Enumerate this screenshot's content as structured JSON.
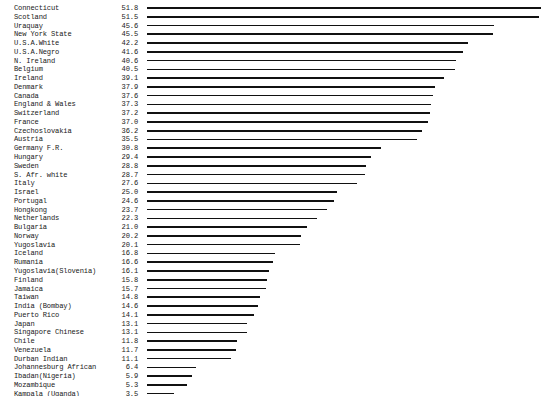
{
  "chart_data": {
    "type": "bar",
    "orientation": "horizontal",
    "title": "",
    "subtitle": "",
    "xlabel": "",
    "ylabel": "",
    "legend": [],
    "grid": false,
    "xlim": [
      0,
      51.8
    ],
    "axis_visible": false,
    "value_labels_shown": true,
    "categories": [
      "Connecticut",
      "Scotland",
      "Uraquay",
      "New York State",
      "U.S.A.White",
      "U.S.A.Negro",
      "N. Ireland",
      "Belgium",
      "Ireland",
      "Denmark",
      "Canada",
      "England & Wales",
      "Switzerland",
      "France",
      "Czechoslovakia",
      "Austria",
      "Germany F.R.",
      "Hungary",
      "Sweden",
      "S. Afr. white",
      "Italy",
      "Israel",
      "Portugal",
      "Hongkong",
      "Netherlands",
      "Bulgaria",
      "Norway",
      "Yugoslavia",
      "Iceland",
      "Rumania",
      "Yugoslavia(Slovenia)",
      "Finland",
      "Jamaica",
      "Taiwan",
      "India (Bombay)",
      "Puerto Rico",
      "Japan",
      "Singapore Chinese",
      "Chile",
      "Venezuela",
      "Durban Indian",
      "Johannesburg African",
      "Ibadan(Nigeria)",
      "Mozambique",
      "Kampala (Uganda)"
    ],
    "values": [
      51.8,
      51.5,
      45.6,
      45.5,
      42.2,
      41.6,
      40.6,
      40.5,
      39.1,
      37.9,
      37.6,
      37.3,
      37.2,
      37.0,
      36.2,
      35.5,
      30.8,
      29.4,
      28.8,
      28.7,
      27.6,
      25.0,
      24.6,
      23.7,
      22.3,
      21.0,
      20.2,
      20.1,
      16.8,
      16.6,
      16.1,
      15.8,
      15.7,
      14.8,
      14.6,
      14.1,
      13.1,
      13.1,
      11.8,
      11.7,
      11.1,
      6.4,
      5.9,
      5.3,
      3.5
    ],
    "value_texts": [
      "51.8",
      "51.5",
      "45.6",
      "45.5",
      "42.2",
      "41.6",
      "40.6",
      "40.5",
      "39.1",
      "37.9",
      "37.6",
      "37.3",
      "37.2",
      "37.0",
      "36.2",
      "35.5",
      "30.8",
      "29.4",
      "28.8",
      "28.7",
      "27.6",
      "25.0",
      "24.6",
      "23.7",
      "22.3",
      "21.0",
      "20.2",
      "20.1",
      "16.8",
      "16.6",
      "16.1",
      "15.8",
      "15.7",
      "14.8",
      "14.6",
      "14.1",
      "13.1",
      "13.1",
      "11.8",
      "11.7",
      "11.1",
      "6.4",
      "5.9",
      "5.3",
      "3.5"
    ],
    "bar_color": "#111111",
    "text_color": "#1a1a1a",
    "background": "#ffffff"
  }
}
